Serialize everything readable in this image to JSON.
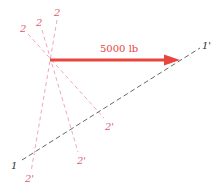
{
  "diagram": {
    "force": {
      "label": "5000 lb",
      "color": "#e8453c",
      "from": [
        50,
        60
      ],
      "to": [
        178,
        60
      ]
    },
    "reference_line": {
      "start_label": "1",
      "end_label": "1'",
      "color": "#555555",
      "from": [
        22,
        160
      ],
      "to": [
        200,
        48
      ]
    },
    "section_lines": [
      {
        "start_label": "2",
        "end_label": "2'",
        "color": "#e89aa8"
      },
      {
        "start_label": "2",
        "end_label": "2'",
        "color": "#e89aa8"
      },
      {
        "start_label": "2",
        "end_label": "2'",
        "color": "#e89aa8"
      }
    ],
    "label_color_pink": "#d9607a",
    "label_color_dark": "#333333"
  }
}
